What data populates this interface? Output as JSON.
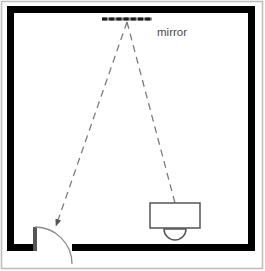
{
  "diagram": {
    "type": "floor-plan",
    "canvas": {
      "width": 265,
      "height": 271
    },
    "colors": {
      "background": "#ffffff",
      "wall": "#000000",
      "outline": "#bfbfbf",
      "furniture_stroke": "#555555",
      "sight_line": "#777777",
      "label_text": "#4a4a4a",
      "mirror_fill": "#8a8a8a"
    },
    "labels": {
      "mirror": "mirror"
    },
    "elements": {
      "outer_frame": {
        "name": "image-border",
        "x": 1,
        "y": 1,
        "width": 262,
        "height": 268
      },
      "room_walls": {
        "name": "room-walls",
        "x": 7,
        "y": 6,
        "width": 248,
        "height": 245,
        "thickness": 7,
        "door_gap": {
          "x_start": 34,
          "x_end": 72
        }
      },
      "mirror": {
        "name": "mirror",
        "x1": 102,
        "x2": 152,
        "y": 19,
        "thickness": 3,
        "dash_pattern": "5 2"
      },
      "desk": {
        "name": "desk",
        "x": 150,
        "y": 203,
        "width": 50,
        "height": 25
      },
      "seat": {
        "name": "seat",
        "cx": 175,
        "cy": 229,
        "radius": 11
      },
      "door": {
        "name": "door",
        "leaf_x": 34,
        "leaf_y_top": 227,
        "leaf_y_bottom": 251,
        "arc_radius": 37,
        "hinge_x": 34,
        "hinge_y": 227
      },
      "sight_lines": [
        {
          "name": "sight-line-to-door",
          "from": {
            "x": 127,
            "y": 22
          },
          "to": {
            "x": 55,
            "y": 227
          },
          "arrow": "end",
          "dash_pattern": "7 5"
        },
        {
          "name": "sight-line-to-desk",
          "from": {
            "x": 127,
            "y": 22
          },
          "to": {
            "x": 175,
            "y": 203
          },
          "arrow": "none",
          "dash_pattern": "7 5"
        }
      ],
      "mirror_label": {
        "name": "mirror-label",
        "x": 157,
        "y": 33
      }
    }
  }
}
